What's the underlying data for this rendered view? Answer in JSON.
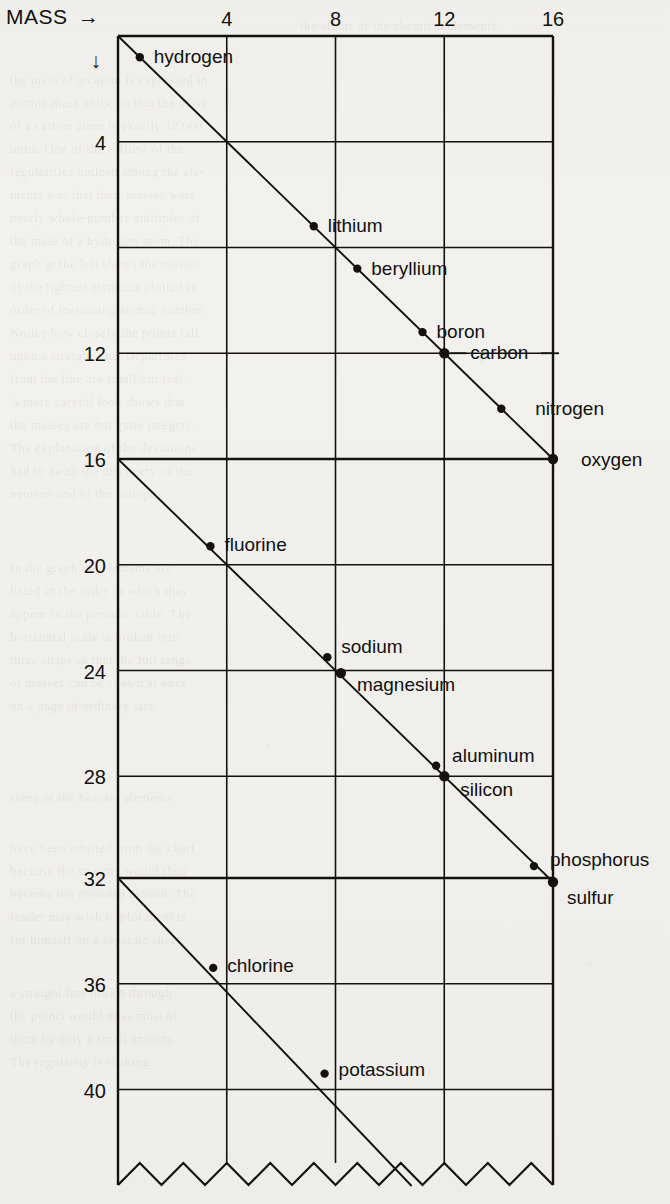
{
  "axes": {
    "x_title": "MASS",
    "x_arrow": "→",
    "y_arrow": "↓",
    "x_ticks": [
      "4",
      "8",
      "12",
      "16"
    ],
    "y_ticks": [
      "4",
      "12",
      "16",
      "20",
      "24",
      "28",
      "32",
      "36",
      "40"
    ]
  },
  "labels": {
    "hydrogen": "hydrogen",
    "lithium": "lithium",
    "beryllium": "beryllium",
    "boron": "boron",
    "carbon": "carbon",
    "nitrogen": "nitrogen",
    "oxygen": "oxygen",
    "fluorine": "fluorine",
    "sodium": "sodium",
    "magnesium": "magnesium",
    "aluminum": "aluminum",
    "silicon": "silicon",
    "phosphorus": "phosphorus",
    "sulfur": "sulfur",
    "chlorine": "chlorine",
    "potassium": "potassium"
  },
  "ghost_text": [
    {
      "x": 300,
      "y": 18,
      "t": "the atoms of the chemical elements"
    },
    {
      "x": 10,
      "y": 72,
      "t": "the mass of an atom is expressed in"
    },
    {
      "x": 10,
      "y": 95,
      "t": "atomic mass units, so that the mass"
    },
    {
      "x": 10,
      "y": 118,
      "t": "of a carbon atom is exactly 12.000"
    },
    {
      "x": 10,
      "y": 141,
      "t": "units. One of the earliest of the"
    },
    {
      "x": 10,
      "y": 164,
      "t": "regularities noticed among the ele-"
    },
    {
      "x": 10,
      "y": 187,
      "t": "ments was that their masses were"
    },
    {
      "x": 10,
      "y": 210,
      "t": "nearly whole-number multiples of"
    },
    {
      "x": 10,
      "y": 233,
      "t": "the mass of a hydrogen atom. The"
    },
    {
      "x": 10,
      "y": 256,
      "t": "graph at the left shows the masses"
    },
    {
      "x": 10,
      "y": 279,
      "t": "of the lightest elements plotted in"
    },
    {
      "x": 10,
      "y": 302,
      "t": "order of increasing atomic number."
    },
    {
      "x": 10,
      "y": 325,
      "t": "Notice how closely the points fall"
    },
    {
      "x": 10,
      "y": 348,
      "t": "upon a straight line. Departures"
    },
    {
      "x": 10,
      "y": 371,
      "t": "from the line are small but real."
    },
    {
      "x": 10,
      "y": 394,
      "t": "A more careful look shows that"
    },
    {
      "x": 10,
      "y": 417,
      "t": "the masses are not quite integers."
    },
    {
      "x": 10,
      "y": 440,
      "t": "The explanation of the deviations"
    },
    {
      "x": 10,
      "y": 463,
      "t": "had to await the discovery of the"
    },
    {
      "x": 10,
      "y": 486,
      "t": "neutron and of the isotopes."
    },
    {
      "x": 10,
      "y": 560,
      "t": "In the graph the elements are"
    },
    {
      "x": 10,
      "y": 583,
      "t": "listed in the order in which they"
    },
    {
      "x": 10,
      "y": 606,
      "t": "appear in the periodic table. The"
    },
    {
      "x": 10,
      "y": 629,
      "t": "horizontal scale is broken into"
    },
    {
      "x": 10,
      "y": 652,
      "t": "three strips so that the full range"
    },
    {
      "x": 10,
      "y": 675,
      "t": "of masses can be shown at once"
    },
    {
      "x": 10,
      "y": 698,
      "t": "on a page of ordinary size."
    },
    {
      "x": 10,
      "y": 790,
      "t": "some of the heavier elements"
    },
    {
      "x": 10,
      "y": 840,
      "t": "have been omitted from the chart"
    },
    {
      "x": 10,
      "y": 863,
      "t": "because the spacing would then"
    },
    {
      "x": 10,
      "y": 886,
      "t": "become too crowded to read. The"
    },
    {
      "x": 10,
      "y": 909,
      "t": "reader may wish to plot them in"
    },
    {
      "x": 10,
      "y": 932,
      "t": "for himself on a separate sheet."
    },
    {
      "x": 10,
      "y": 985,
      "t": "a straight line drawn through"
    },
    {
      "x": 10,
      "y": 1008,
      "t": "the points would miss most of"
    },
    {
      "x": 10,
      "y": 1031,
      "t": "them by only a small amount."
    },
    {
      "x": 10,
      "y": 1054,
      "t": "The regularity is striking."
    }
  ],
  "chart_data": {
    "type": "scatter",
    "title": "",
    "xlabel": "MASS",
    "ylabel": "",
    "grid": true,
    "note": "Atomic masses of the light elements plotted on a wrapped axis. The mass axis runs left-to-right 0-16 in each of three stacked bands; the vertical axis labels give the continuing mass value 0-16, 16-32, 32-48. Each point lies at (mass mod 16) horizontally and at mass vertically within its band.",
    "xlim": [
      0,
      16
    ],
    "bands": [
      {
        "y_from": 0,
        "y_to": 16
      },
      {
        "y_from": 16,
        "y_to": 32
      },
      {
        "y_from": 32,
        "y_to": 48
      }
    ],
    "x_ticks": [
      4,
      8,
      12,
      16
    ],
    "y_ticks": [
      4,
      8,
      12,
      16,
      20,
      24,
      28,
      32,
      36,
      40
    ],
    "y_tick_labels": [
      "4",
      "",
      "12",
      "16",
      "20",
      "24",
      "28",
      "32",
      "36",
      "40"
    ],
    "points": [
      {
        "name": "hydrogen",
        "mass": 1,
        "band": 0,
        "x": 0.8,
        "y": 0.8,
        "label_side": "right"
      },
      {
        "name": "lithium",
        "mass": 7,
        "band": 0,
        "x": 7.2,
        "y": 7.2,
        "label_side": "right"
      },
      {
        "name": "beryllium",
        "mass": 9,
        "band": 0,
        "x": 8.8,
        "y": 8.8,
        "label_side": "right"
      },
      {
        "name": "boron",
        "mass": 11,
        "band": 0,
        "x": 11.2,
        "y": 11.2,
        "label_side": "right"
      },
      {
        "name": "carbon",
        "mass": 12,
        "band": 0,
        "x": 12.0,
        "y": 12.0,
        "label_side": "right"
      },
      {
        "name": "nitrogen",
        "mass": 14,
        "band": 0,
        "x": 14.1,
        "y": 14.1,
        "label_side": "right"
      },
      {
        "name": "oxygen",
        "mass": 16,
        "band": 0,
        "x": 16.0,
        "y": 16.0,
        "label_side": "right"
      },
      {
        "name": "fluorine",
        "mass": 19,
        "band": 1,
        "x": 3.4,
        "y": 19.3,
        "label_side": "right"
      },
      {
        "name": "sodium",
        "mass": 23,
        "band": 1,
        "x": 7.7,
        "y": 23.5,
        "label_side": "right"
      },
      {
        "name": "magnesium",
        "mass": 24,
        "band": 1,
        "x": 8.2,
        "y": 24.1,
        "label_side": "right"
      },
      {
        "name": "aluminum",
        "mass": 27,
        "band": 1,
        "x": 11.7,
        "y": 27.6,
        "label_side": "right"
      },
      {
        "name": "silicon",
        "mass": 28,
        "band": 1,
        "x": 12.0,
        "y": 28.0,
        "label_side": "right"
      },
      {
        "name": "phosphorus",
        "mass": 31,
        "band": 1,
        "x": 15.3,
        "y": 31.4,
        "label_side": "right"
      },
      {
        "name": "sulfur",
        "mass": 32,
        "band": 1,
        "x": 16.0,
        "y": 32.0,
        "label_side": "right"
      },
      {
        "name": "chlorine",
        "mass": 35,
        "band": 2,
        "x": 3.5,
        "y": 35.4,
        "label_side": "right"
      },
      {
        "name": "potassium",
        "mass": 39,
        "band": 2,
        "x": 7.6,
        "y": 39.4,
        "label_side": "right"
      }
    ]
  }
}
